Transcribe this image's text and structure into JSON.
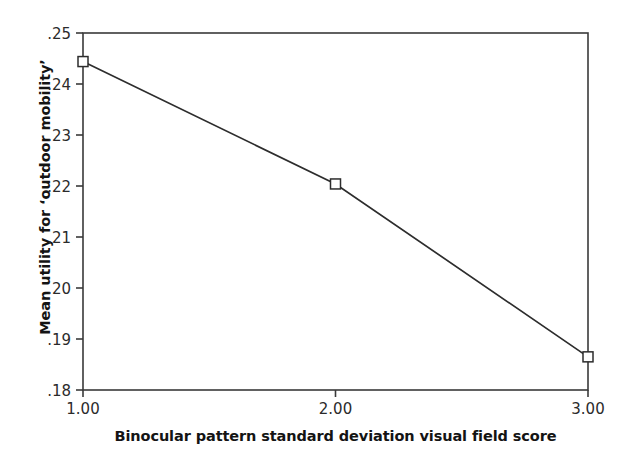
{
  "figure": {
    "background_color": "#ffffff",
    "line_color": "#2d2d2d",
    "axis_color": "#3a3a3a",
    "text_color": "#141414"
  },
  "chart_data": {
    "type": "line",
    "title": "",
    "subtitle": "",
    "xlabel": "Binocular pattern standard deviation visual field score",
    "ylabel": "Mean utility for ‘outdoor mobility’",
    "x": [
      1.0,
      2.0,
      3.0
    ],
    "values": [
      0.2444,
      0.2204,
      0.1865
    ],
    "series": [
      {
        "name": "Mean utility for 'outdoor mobility'",
        "values": [
          0.2444,
          0.2204,
          0.1865
        ]
      }
    ],
    "xlim": [
      1.0,
      3.0
    ],
    "ylim": [
      0.18,
      0.25
    ],
    "xticks": [
      1.0,
      2.0,
      3.0
    ],
    "xticklabels": [
      "1.00",
      "2.00",
      "3.00"
    ],
    "yticks": [
      0.18,
      0.19,
      0.2,
      0.21,
      0.22,
      0.23,
      0.24,
      0.25
    ],
    "yticklabels": [
      ".18",
      ".19",
      ".20",
      ".21",
      ".22",
      ".23",
      ".24",
      ".25"
    ],
    "grid": false,
    "legend": false,
    "legend_position": "none",
    "marker": "open-square",
    "annotations": []
  }
}
